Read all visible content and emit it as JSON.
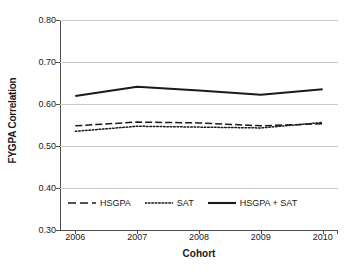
{
  "chart_data": {
    "type": "line",
    "title": "",
    "xlabel": "Cohort",
    "ylabel": "FYGPA Correlation",
    "categories": [
      "2006",
      "2007",
      "2008",
      "2009",
      "2010"
    ],
    "x": [
      2006,
      2007,
      2008,
      2009,
      2010
    ],
    "ylim": [
      0.3,
      0.8
    ],
    "yticks": [
      "0.30",
      "0.40",
      "0.50",
      "0.60",
      "0.70",
      "0.80"
    ],
    "ytick_values": [
      0.3,
      0.4,
      0.5,
      0.6,
      0.7,
      0.8
    ],
    "grid": true,
    "legend_position": "inside-bottom-left",
    "series": [
      {
        "name": "HSGPA",
        "style": "dashed",
        "color": "#1a1a1a",
        "values": [
          0.548,
          0.557,
          0.555,
          0.548,
          0.553
        ]
      },
      {
        "name": "SAT",
        "style": "dotted",
        "color": "#1a1a1a",
        "values": [
          0.535,
          0.547,
          0.545,
          0.543,
          0.556
        ]
      },
      {
        "name": "HSGPA + SAT",
        "style": "solid",
        "color": "#1a1a1a",
        "values": [
          0.619,
          0.641,
          0.632,
          0.622,
          0.635
        ]
      }
    ]
  },
  "axes": {
    "y_title": "FYGPA Correlation",
    "x_title": "Cohort",
    "y_labels": [
      "0.80",
      "0.70",
      "0.60",
      "0.50",
      "0.40",
      "0.30"
    ],
    "x_labels": [
      "2006",
      "2007",
      "2008",
      "2009",
      "2010"
    ]
  },
  "legend": {
    "items": [
      {
        "label": "HSGPA",
        "style": "dashed"
      },
      {
        "label": "SAT",
        "style": "dotted"
      },
      {
        "label": "HSGPA + SAT",
        "style": "solid"
      }
    ]
  },
  "colors": {
    "ink": "#1a1a1a",
    "gridline": "#c9c9c9",
    "axis": "#4d4d4d",
    "background": "#ffffff"
  }
}
